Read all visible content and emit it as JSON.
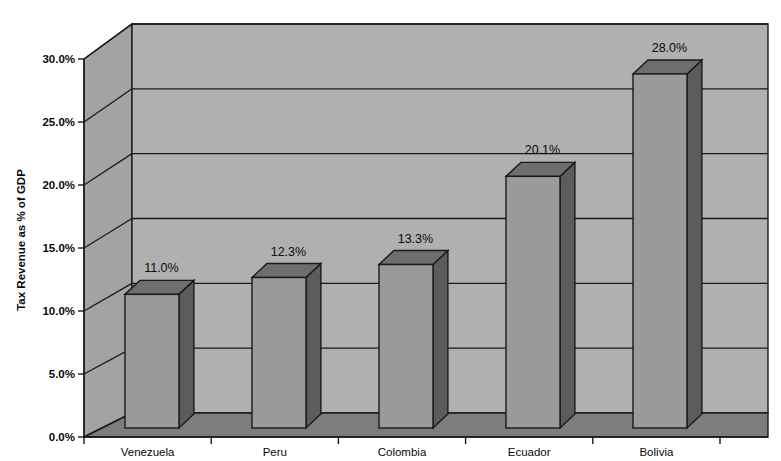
{
  "chart_data": {
    "type": "bar",
    "title": "",
    "subtitle": "",
    "xlabel": "",
    "ylabel": "Tax Revenue as % of GDP",
    "categories": [
      "Venezuela",
      "Peru",
      "Colombia",
      "Ecuador",
      "Bolivia"
    ],
    "values": [
      11.0,
      12.3,
      13.3,
      20.1,
      28.0
    ],
    "data_labels": [
      "11.0%",
      "12.3%",
      "13.3%",
      "20.1%",
      "28.0%"
    ],
    "ylim": [
      0,
      30
    ],
    "ytick_values": [
      0,
      5,
      10,
      15,
      20,
      25,
      30
    ],
    "ytick_labels": [
      "0.0%",
      "5.0%",
      "10.0%",
      "15.0%",
      "20.0%",
      "25.0%",
      "30.0%"
    ],
    "grid": true,
    "legend": "none",
    "style": "3d-column",
    "colors": {
      "background": "#ffffff",
      "wall": "#b0b0b0",
      "wall_side": "#a3a3a3",
      "floor": "#7d7d7d",
      "bar_front": "#9a9a9a",
      "bar_side": "#5c5c5c",
      "bar_top": "#6e6e6e",
      "outline": "#1a1a1a",
      "text": "#0a0a0a"
    }
  }
}
